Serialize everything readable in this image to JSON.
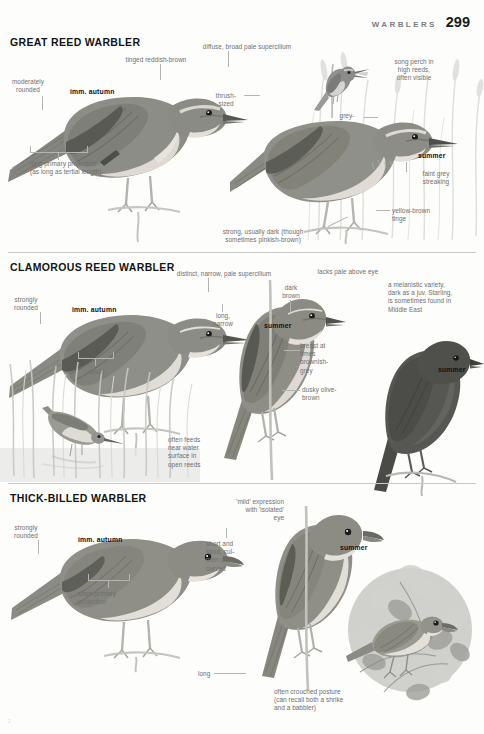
{
  "running_head": {
    "label": "WARBLERS",
    "page_number": "299"
  },
  "corner_mark": "2",
  "sections": [
    {
      "id": "great-reed-warbler",
      "title": "GREAT REED WARBLER",
      "annotations": [
        {
          "name": "moderately-rounded",
          "text": "moderately\nrounded",
          "bold": false
        },
        {
          "name": "imm-autumn-1",
          "text": "imm. autumn",
          "bold": true
        },
        {
          "name": "tinged-reddish-brown",
          "text": "tinged reddish-brown",
          "bold": false
        },
        {
          "name": "diffuse-broad-pale-supercilium",
          "text": "diffuse, broad pale supercilium",
          "bold": false
        },
        {
          "name": "thrush-sized",
          "text": "thrush-\nsized",
          "bold": false
        },
        {
          "name": "song-perch",
          "text": "song perch in\nhigh reeds,\noften visible",
          "bold": false
        },
        {
          "name": "grey-brown",
          "text": "grey-\nbrown",
          "bold": false
        },
        {
          "name": "summer-1",
          "text": "summer",
          "bold": true
        },
        {
          "name": "faint-grey-streaking",
          "text": "faint grey\nstreaking",
          "bold": false
        },
        {
          "name": "yellow-brown-tinge",
          "text": "yellow-brown\ntinge",
          "bold": false
        },
        {
          "name": "long-primary-projection",
          "text": "long primary projection\n(as long as tertial length)",
          "bold": false
        },
        {
          "name": "strong-dark-bill",
          "text": "strong, usually dark (though\nsometimes pinkish-brown)",
          "bold": false
        }
      ]
    },
    {
      "id": "clamorous-reed-warbler",
      "title": "CLAMOROUS REED WARBLER",
      "annotations": [
        {
          "name": "strongly-rounded-2",
          "text": "strongly\nrounded",
          "bold": false
        },
        {
          "name": "imm-autumn-2",
          "text": "imm. autumn",
          "bold": true
        },
        {
          "name": "distinct-narrow-pale-supercilium",
          "text": "distinct, narrow, pale supercilium",
          "bold": false
        },
        {
          "name": "lacks-pale-above-eye",
          "text": "lacks pale above eye",
          "bold": false
        },
        {
          "name": "dark-brown",
          "text": "dark\nbrown",
          "bold": false
        },
        {
          "name": "long-narrow",
          "text": "long,\nnarrow",
          "bold": false
        },
        {
          "name": "melanistic-variety",
          "text": "a melanistic variety,\ndark as a juv. Starling,\nis sometimes found in\nMiddle East",
          "bold": false
        },
        {
          "name": "summer-2",
          "text": "summer",
          "bold": true
        },
        {
          "name": "summer-3",
          "text": "summer",
          "bold": true
        },
        {
          "name": "breast-brownish-grey",
          "text": "breast at\ntimes\nbrownish-\ngrey",
          "bold": false
        },
        {
          "name": "dusky-olive-brown",
          "text": "dusky olive-\nbrown",
          "bold": false
        },
        {
          "name": "short",
          "text": "short",
          "bold": false
        },
        {
          "name": "often-feeds-near-water",
          "text": "often feeds\nnear water\nsurface in\nopen reeds",
          "bold": false
        }
      ]
    },
    {
      "id": "thick-billed-warbler",
      "title": "THICK-BILLED WARBLER",
      "annotations": [
        {
          "name": "strongly-rounded-3",
          "text": "strongly\nrounded",
          "bold": false
        },
        {
          "name": "imm-autumn-3",
          "text": "imm. autumn",
          "bold": true
        },
        {
          "name": "mild-expression",
          "text": "'mild' expression\nwith 'isolated'\neye",
          "bold": false
        },
        {
          "name": "short-stout-culmen",
          "text": "short and\nstout, cul-\nmen de-\ncurved",
          "bold": false
        },
        {
          "name": "summer-4",
          "text": "summer",
          "bold": true
        },
        {
          "name": "short-primary-projection",
          "text": "short primary\nprojection",
          "bold": false
        },
        {
          "name": "long",
          "text": "long",
          "bold": false
        },
        {
          "name": "often-crouched-posture",
          "text": "often crouched posture\n(can recall both a shrike\nand a babbler)",
          "bold": false
        }
      ]
    }
  ],
  "colors": {
    "paper": "#fdfdfc",
    "text": "#141414",
    "annotation": "#6e6e6e",
    "rule": "#c9c9c9",
    "leader": "#b4b4b4",
    "plumage_upper": "#8d8d8d",
    "plumage_under": "#e2e0dc",
    "plumage_dark": "#4a4a4a",
    "melanistic": "#4e4e4e"
  }
}
